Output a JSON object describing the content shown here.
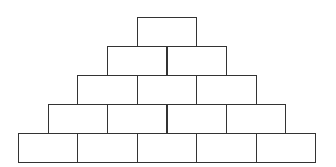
{
  "diagram": {
    "type": "brick-pyramid",
    "rows": [
      1,
      2,
      3,
      4,
      5
    ],
    "brick_width": 59.4,
    "brick_height": 29,
    "bottom_left_x": 18,
    "bottom_y": 133,
    "stroke_color": "#333333",
    "fill_color": "#ffffff"
  }
}
